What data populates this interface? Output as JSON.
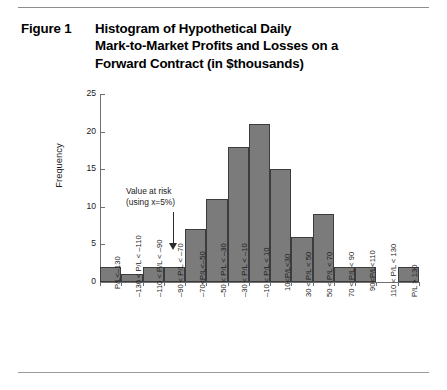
{
  "figure": {
    "label": "Figure 1",
    "title_lines": [
      "Histogram of Hypothetical Daily",
      "Mark-to-Market Profits and Losses on a",
      "Forward Contract (in $thousands)"
    ]
  },
  "annotation": {
    "line1": "Value at risk",
    "line2": "(using x=5%)",
    "arrow": "down-arrow-icon"
  },
  "chart_data": {
    "type": "bar",
    "xlabel": "",
    "ylabel": "Frequency",
    "ylim": [
      0,
      25
    ],
    "yticks": [
      0,
      5,
      10,
      15,
      20,
      25
    ],
    "ytick_labels": [
      "0",
      "5",
      "10",
      "15",
      "20",
      "25"
    ],
    "grid": false,
    "legend": null,
    "bar_color": "#7b7b7b",
    "bar_edge_color": "#3c3c3c",
    "categories": [
      "P/L<–130",
      "–130 < P/L < –110",
      "–110 < P/L < –90",
      "–90 < P/L < –70",
      "–70<P/L<–50",
      "–50 < P/L < –30",
      "–30 < P/L < –10",
      "–10 < P/L < 10",
      "10<P/L<30",
      "30 < P/L < 50",
      "50 < P/L < 70",
      "70 < P/L < 90",
      "90<P/L<110",
      "110 < P/L < 130",
      "P/L > 130"
    ],
    "values": [
      2,
      1,
      2,
      2,
      7,
      11,
      18,
      21,
      15,
      6,
      9,
      2,
      2,
      0,
      2
    ],
    "annotations": [
      {
        "text": "Value at risk (using x=5%)",
        "points_to_category": "–90 < P/L < –70"
      }
    ]
  }
}
